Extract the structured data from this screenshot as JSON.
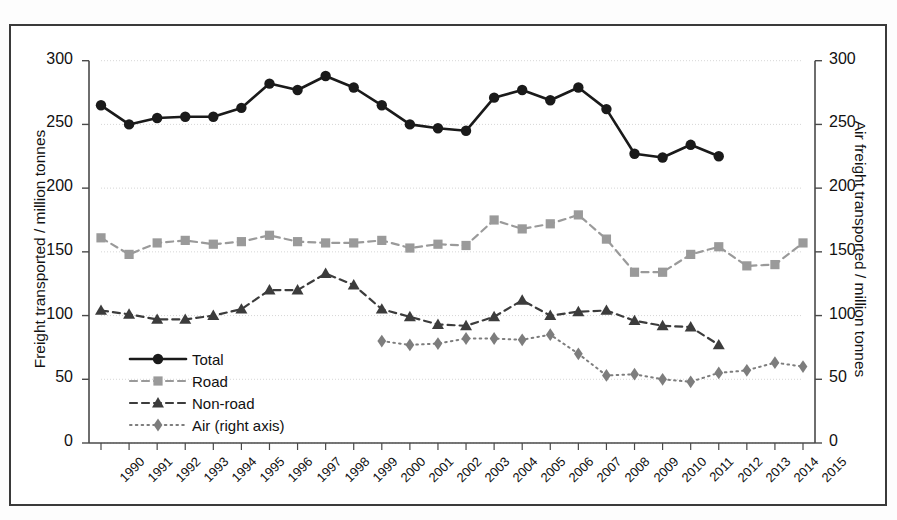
{
  "axes": {
    "ylabel_left": "Freight transported / million tonnes",
    "ylabel_right": "Air freight transported / million tonnes",
    "yticks": [
      "0",
      "50",
      "100",
      "150",
      "200",
      "250",
      "300"
    ],
    "yticks_right": [
      "0",
      "50",
      "100",
      "150",
      "200",
      "250",
      "300"
    ]
  },
  "legend": {
    "items": [
      {
        "label": "Total",
        "key": "solid-circle-black",
        "color": "#1a1a1a"
      },
      {
        "label": "Road",
        "key": "dashed-square-gray",
        "color": "#9a9a9a"
      },
      {
        "label": "Non-road",
        "key": "dashed-triangle-dark",
        "color": "#3c3c3c"
      },
      {
        "label": "Air (right axis)",
        "key": "dotted-diamond-gray",
        "color": "#7d7d7d"
      }
    ]
  },
  "chart_data": {
    "type": "line",
    "title": "",
    "xlabel": "",
    "ylabel": "Freight transported / million tonnes",
    "ylabel_right": "Air freight transported / million tonnes",
    "ylim": [
      0,
      300
    ],
    "ylim_right": [
      0,
      300
    ],
    "grid": true,
    "legend_position": "inside-left-lower",
    "categories": [
      "1990",
      "1991",
      "1992",
      "1993",
      "1994",
      "1995",
      "1996",
      "1997",
      "1998",
      "1999",
      "2000",
      "2001",
      "2002",
      "2003",
      "2004",
      "2005",
      "2006",
      "2007",
      "2008",
      "2009",
      "2010",
      "2011",
      "2012",
      "2013",
      "2014",
      "2015"
    ],
    "series": [
      {
        "name": "Total",
        "axis": "left",
        "marker": "circle",
        "linestyle": "solid",
        "color": "#1a1a1a",
        "values": [
          265,
          250,
          255,
          256,
          256,
          263,
          282,
          277,
          288,
          279,
          265,
          250,
          247,
          245,
          271,
          277,
          269,
          279,
          262,
          227,
          224,
          234,
          225,
          null,
          null,
          null
        ]
      },
      {
        "name": "Road",
        "axis": "left",
        "marker": "square",
        "linestyle": "dashed",
        "color": "#9a9a9a",
        "values": [
          161,
          148,
          157,
          159,
          156,
          158,
          163,
          158,
          157,
          157,
          159,
          153,
          156,
          155,
          175,
          168,
          172,
          179,
          160,
          134,
          134,
          148,
          154,
          139,
          140,
          157
        ]
      },
      {
        "name": "Non-road",
        "axis": "left",
        "marker": "triangle",
        "linestyle": "dashed",
        "color": "#3c3c3c",
        "values": [
          104,
          101,
          97,
          97,
          100,
          105,
          120,
          120,
          133,
          124,
          105,
          99,
          93,
          92,
          99,
          112,
          100,
          103,
          104,
          96,
          92,
          91,
          77,
          null,
          null,
          null
        ]
      },
      {
        "name": "Air (right axis)",
        "axis": "right",
        "marker": "diamond",
        "linestyle": "dotted",
        "color": "#7d7d7d",
        "values": [
          null,
          null,
          null,
          null,
          null,
          null,
          null,
          null,
          null,
          null,
          80,
          77,
          78,
          82,
          82,
          81,
          85,
          70,
          53,
          54,
          50,
          48,
          55,
          57,
          63,
          60
        ]
      }
    ]
  }
}
